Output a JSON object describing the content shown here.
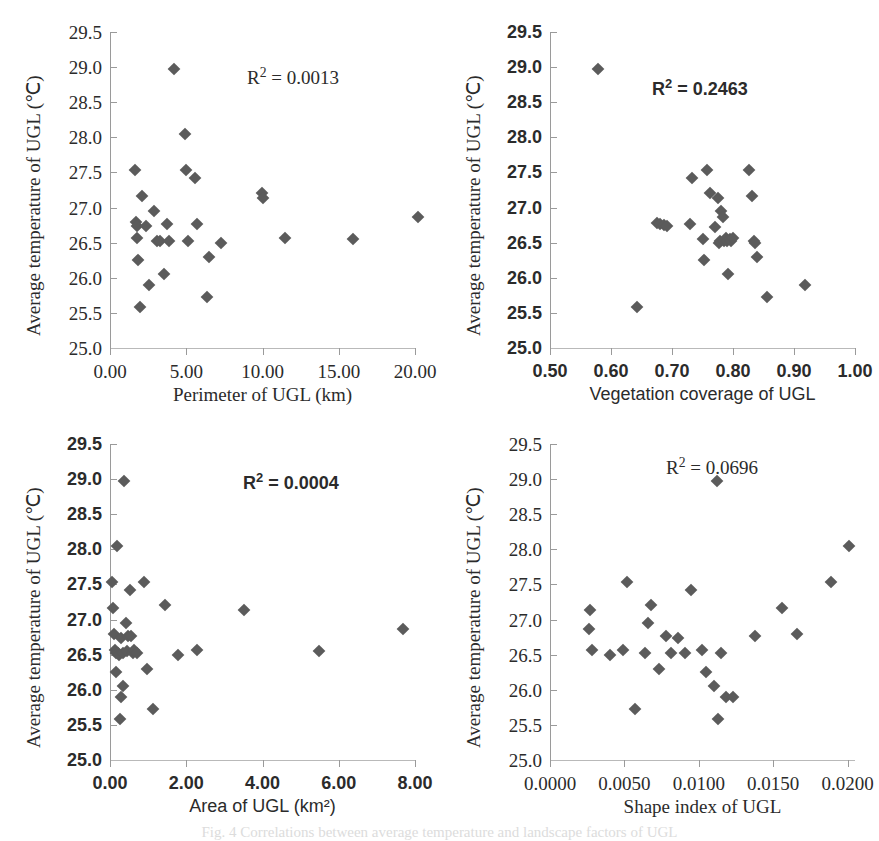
{
  "figure": {
    "caption": "Fig. 4 Correlations between average temperature and landscape factors of UGL",
    "marker_color": "#5b5b5b",
    "axis_color": "#9a9a9a"
  },
  "chart_data": [
    {
      "id": "perimeter",
      "type": "scatter",
      "title": "",
      "xlabel": "Perimeter of UGL (km)",
      "ylabel": "Average temperature of  UGL (℃)",
      "annotation": "R² = 0.0013",
      "r_squared": 0.0013,
      "xlim": [
        0.0,
        20.0
      ],
      "ylim": [
        25.0,
        29.5
      ],
      "xticks": [
        0.0,
        5.0,
        10.0,
        15.0,
        20.0
      ],
      "xticklabels": [
        "0.00",
        "5.00",
        "10.00",
        "15.00",
        "20.00"
      ],
      "yticks": [
        25.0,
        25.5,
        26.0,
        26.5,
        27.0,
        27.5,
        28.0,
        28.5,
        29.0,
        29.5
      ],
      "yticklabels": [
        "25.0",
        "25.5",
        "26.0",
        "26.5",
        "27.0",
        "27.5",
        "28.0",
        "28.5",
        "29.0",
        "29.5"
      ],
      "grid": false,
      "x": [
        1.65,
        1.7,
        1.75,
        1.8,
        1.85,
        1.95,
        2.1,
        2.35,
        2.55,
        2.9,
        3.05,
        3.3,
        3.55,
        3.75,
        3.9,
        4.2,
        4.9,
        5.0,
        5.1,
        5.6,
        5.7,
        6.35,
        6.5,
        7.3,
        9.95,
        10.05,
        11.45,
        15.95,
        20.2
      ],
      "y": [
        27.54,
        26.79,
        26.74,
        26.56,
        26.25,
        25.59,
        27.17,
        26.74,
        25.9,
        26.95,
        26.52,
        26.53,
        26.05,
        26.77,
        26.53,
        28.97,
        28.05,
        27.54,
        26.53,
        27.42,
        26.76,
        25.72,
        26.3,
        26.5,
        27.21,
        27.13,
        26.56,
        26.55,
        26.87
      ]
    },
    {
      "id": "vegetation",
      "type": "scatter",
      "title": "",
      "xlabel": "Vegetation coverage of UGL",
      "ylabel": "Average temperature of  UGL (℃)",
      "annotation": "R² = 0.2463",
      "r_squared": 0.2463,
      "xlim": [
        0.5,
        1.0
      ],
      "ylim": [
        25.0,
        29.5
      ],
      "xticks": [
        0.5,
        0.6,
        0.7,
        0.8,
        0.9,
        1.0
      ],
      "xticklabels": [
        "0.50",
        "0.60",
        "0.70",
        "0.80",
        "0.90",
        "1.00"
      ],
      "yticks": [
        25.0,
        25.5,
        26.0,
        26.5,
        27.0,
        27.5,
        28.0,
        28.5,
        29.0,
        29.5
      ],
      "yticklabels": [
        "25.0",
        "25.5",
        "26.0",
        "26.5",
        "27.0",
        "27.5",
        "28.0",
        "28.5",
        "29.0",
        "29.5"
      ],
      "grid": false,
      "x": [
        0.578,
        0.642,
        0.676,
        0.68,
        0.687,
        0.692,
        0.73,
        0.733,
        0.751,
        0.753,
        0.757,
        0.762,
        0.771,
        0.775,
        0.777,
        0.779,
        0.781,
        0.784,
        0.786,
        0.788,
        0.79,
        0.792,
        0.795,
        0.797,
        0.8,
        0.827,
        0.831,
        0.834,
        0.836,
        0.839,
        0.855,
        0.918
      ],
      "y": [
        28.97,
        25.59,
        26.78,
        26.77,
        26.75,
        26.74,
        26.77,
        27.42,
        26.55,
        26.25,
        27.54,
        27.21,
        26.73,
        27.13,
        26.5,
        26.53,
        26.95,
        26.87,
        26.53,
        26.56,
        26.52,
        26.05,
        26.55,
        26.53,
        26.56,
        27.54,
        27.17,
        26.52,
        26.5,
        26.3,
        25.72,
        25.9
      ]
    },
    {
      "id": "area",
      "type": "scatter",
      "title": "",
      "xlabel": "Area of UGL (km²)",
      "ylabel": "Average temperature of  UGL (℃)",
      "annotation": "R² = 0.0004",
      "r_squared": 0.0004,
      "xlim": [
        0.0,
        8.0
      ],
      "ylim": [
        25.0,
        29.5
      ],
      "xticks": [
        0.0,
        2.0,
        4.0,
        6.0,
        8.0
      ],
      "xticklabels": [
        "0.00",
        "2.00",
        "4.00",
        "6.00",
        "8.00"
      ],
      "yticks": [
        25.0,
        25.5,
        26.0,
        26.5,
        27.0,
        27.5,
        28.0,
        28.5,
        29.0,
        29.5
      ],
      "yticklabels": [
        "25.0",
        "25.5",
        "26.0",
        "26.5",
        "27.0",
        "27.5",
        "28.0",
        "28.5",
        "29.0",
        "29.5"
      ],
      "grid": false,
      "x": [
        0.04,
        0.07,
        0.1,
        0.13,
        0.15,
        0.17,
        0.19,
        0.21,
        0.24,
        0.26,
        0.28,
        0.3,
        0.33,
        0.35,
        0.38,
        0.41,
        0.44,
        0.47,
        0.52,
        0.56,
        0.6,
        0.64,
        0.7,
        0.88,
        0.96,
        1.12,
        1.45,
        1.78,
        2.28,
        3.52,
        5.48,
        7.68
      ],
      "y": [
        27.54,
        27.17,
        26.79,
        26.56,
        26.53,
        26.25,
        28.05,
        26.52,
        26.5,
        25.59,
        26.74,
        25.9,
        26.53,
        26.05,
        28.97,
        26.95,
        26.55,
        26.76,
        27.42,
        26.77,
        26.53,
        26.56,
        26.52,
        27.54,
        26.3,
        25.72,
        27.21,
        26.5,
        26.56,
        27.13,
        26.55,
        26.87
      ]
    },
    {
      "id": "shape",
      "type": "scatter",
      "title": "",
      "xlabel": "Shape index of UGL",
      "ylabel": "Average temperature of  UGL (℃)",
      "annotation": "R² = 0.0696",
      "r_squared": 0.0696,
      "xlim": [
        0.0,
        0.0205
      ],
      "ylim": [
        25.0,
        29.5
      ],
      "xticks": [
        0.0,
        0.005,
        0.01,
        0.015,
        0.02
      ],
      "xticklabels": [
        "0.0000",
        "0.0050",
        "0.0100",
        "0.0150",
        "0.0200"
      ],
      "yticks": [
        25.0,
        25.5,
        26.0,
        26.5,
        27.0,
        27.5,
        28.0,
        28.5,
        29.0,
        29.5
      ],
      "yticklabels": [
        "25.0",
        "25.5",
        "26.0",
        "26.5",
        "27.0",
        "27.5",
        "28.0",
        "28.5",
        "29.0",
        "29.5"
      ],
      "grid": false,
      "x": [
        0.0026,
        0.0027,
        0.0028,
        0.004,
        0.0049,
        0.0052,
        0.0057,
        0.0064,
        0.0066,
        0.0068,
        0.0073,
        0.0078,
        0.0081,
        0.0086,
        0.0091,
        0.0095,
        0.0102,
        0.0105,
        0.011,
        0.0112,
        0.0113,
        0.0115,
        0.0118,
        0.0123,
        0.0138,
        0.0156,
        0.0166,
        0.0189,
        0.0201
      ],
      "y": [
        26.87,
        27.13,
        26.56,
        26.5,
        26.56,
        27.54,
        25.72,
        26.53,
        26.95,
        27.21,
        26.3,
        26.77,
        26.52,
        26.74,
        26.52,
        27.42,
        26.56,
        26.25,
        26.05,
        28.97,
        25.59,
        26.53,
        25.9,
        25.9,
        26.76,
        27.17,
        26.79,
        27.54,
        28.05
      ]
    }
  ]
}
